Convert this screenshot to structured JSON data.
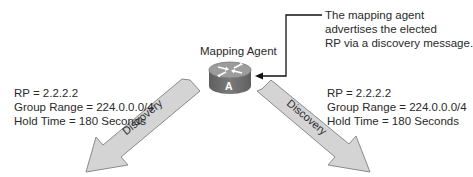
{
  "router": {
    "label": "Mapping Agent",
    "id_letter": "A"
  },
  "callout": {
    "lines": [
      "The mapping agent",
      "advertises the elected",
      "RP via a discovery message."
    ]
  },
  "left_info": {
    "lines": [
      "RP = 2.2.2.2",
      "Group Range = 224.0.0.0/4",
      "Hold Time = 180 Seconds"
    ]
  },
  "right_info": {
    "lines": [
      "RP = 2.2.2.2",
      "Group Range = 224.0.0.0/4",
      "Hold Time = 180 Seconds"
    ]
  },
  "arrows": {
    "left_label": "Discovery",
    "right_label": "Discovery"
  },
  "colors": {
    "arrow_fill": "#d4d4d4",
    "arrow_stroke": "#8a8a8a",
    "router_top": "#9a9a9a",
    "router_side": "#6f6f6f",
    "line": "#111111"
  }
}
